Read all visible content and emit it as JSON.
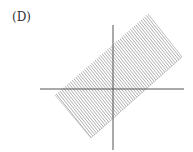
{
  "figure": {
    "label": "(D)",
    "colors": {
      "axis": "#555555",
      "hatch": "#888888",
      "text": "#333333"
    }
  }
}
